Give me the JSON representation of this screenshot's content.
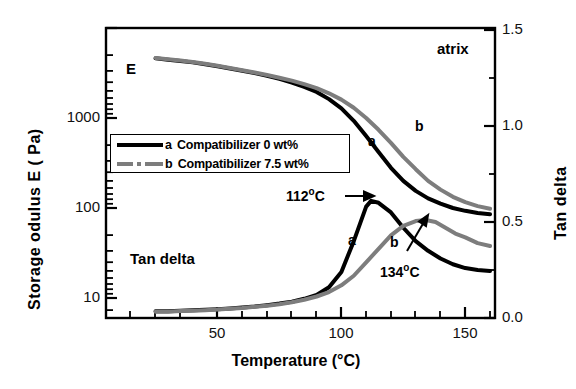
{
  "chart_data": {
    "type": "line",
    "title": "",
    "annotation_corner": "atrix",
    "xlabel": "Temperature (°C)",
    "ylabel_left": "Storage  odulus E ( Pa)",
    "ylabel_right": "Tan delta",
    "xlim": [
      5,
      162
    ],
    "xticks": [
      50,
      100,
      150
    ],
    "xticklabels": [
      "50",
      "100",
      "150"
    ],
    "left_axis_scale": "log",
    "ylim_left": [
      10,
      10000
    ],
    "yticks_left": [
      10,
      100,
      1000
    ],
    "yticklabels_left": [
      "10",
      "100",
      "1000"
    ],
    "ylim_right": [
      0.0,
      1.5
    ],
    "yticks_right": [
      0.0,
      0.5,
      1.0,
      1.5
    ],
    "yticklabels_right": [
      "0.0",
      "0.5",
      "1.0",
      "1.5"
    ],
    "grid": false,
    "in_plot_labels": [
      "E",
      "Tan delta"
    ],
    "curve_labels": [
      {
        "text": "a",
        "axis": "modulus"
      },
      {
        "text": "b",
        "axis": "modulus"
      },
      {
        "text": "a",
        "axis": "tandelta"
      },
      {
        "text": "b",
        "axis": "tandelta"
      }
    ],
    "annotations": [
      {
        "text": "112",
        "unit": "o",
        "suffix": "C",
        "points_to": "tan delta peak a",
        "value_c": 112
      },
      {
        "text": "134",
        "unit": "o",
        "suffix": "C",
        "points_to": "tan delta peak b",
        "value_c": 134
      }
    ],
    "series": [
      {
        "name": "a  Compatibilizer 0 wt%",
        "label": "a",
        "color": "#000000",
        "style": "solid",
        "axis": "left",
        "quantity": "Storage modulus E (Pa)",
        "x": [
          25,
          30,
          35,
          40,
          45,
          50,
          55,
          60,
          65,
          70,
          75,
          80,
          85,
          90,
          95,
          100,
          105,
          110,
          115,
          120,
          125,
          130,
          135,
          140,
          145,
          150,
          155,
          160
        ],
        "y": [
          4600,
          4450,
          4300,
          4150,
          3950,
          3750,
          3550,
          3350,
          3150,
          2950,
          2720,
          2480,
          2220,
          1950,
          1620,
          1280,
          930,
          630,
          420,
          280,
          200,
          155,
          128,
          112,
          100,
          93,
          88,
          85
        ]
      },
      {
        "name": "b  Compatibilizer 7.5 wt%",
        "label": "b",
        "color": "#7d7d7d",
        "style": "solid-gray",
        "axis": "left",
        "quantity": "Storage modulus E (Pa)",
        "x": [
          25,
          30,
          35,
          40,
          45,
          50,
          55,
          60,
          65,
          70,
          75,
          80,
          85,
          90,
          95,
          100,
          105,
          110,
          115,
          120,
          125,
          130,
          135,
          140,
          145,
          150,
          155,
          160
        ],
        "y": [
          4650,
          4500,
          4350,
          4200,
          4000,
          3800,
          3600,
          3400,
          3200,
          3000,
          2800,
          2600,
          2380,
          2150,
          1880,
          1600,
          1300,
          1000,
          740,
          530,
          370,
          270,
          200,
          160,
          133,
          116,
          105,
          98
        ]
      },
      {
        "name": "a  Compatibilizer 0 wt%",
        "label": "a",
        "color": "#000000",
        "style": "solid",
        "axis": "right",
        "quantity": "Tan delta",
        "x": [
          25,
          30,
          35,
          40,
          45,
          50,
          55,
          60,
          65,
          70,
          75,
          80,
          85,
          90,
          95,
          100,
          105,
          110,
          112,
          115,
          120,
          125,
          130,
          135,
          140,
          145,
          150,
          155,
          160
        ],
        "y": [
          0.035,
          0.035,
          0.038,
          0.04,
          0.043,
          0.046,
          0.05,
          0.055,
          0.06,
          0.067,
          0.075,
          0.085,
          0.1,
          0.12,
          0.16,
          0.24,
          0.4,
          0.58,
          0.61,
          0.6,
          0.55,
          0.47,
          0.4,
          0.35,
          0.31,
          0.28,
          0.26,
          0.25,
          0.245
        ]
      },
      {
        "name": "b  Compatibilizer 7.5 wt%",
        "label": "b",
        "color": "#7d7d7d",
        "style": "solid-gray",
        "axis": "right",
        "quantity": "Tan delta",
        "x": [
          25,
          30,
          35,
          40,
          45,
          50,
          55,
          60,
          65,
          70,
          75,
          80,
          85,
          90,
          95,
          100,
          105,
          110,
          115,
          120,
          125,
          130,
          134,
          138,
          142,
          146,
          150,
          155,
          160
        ],
        "y": [
          0.033,
          0.033,
          0.036,
          0.038,
          0.041,
          0.044,
          0.048,
          0.052,
          0.058,
          0.064,
          0.072,
          0.082,
          0.095,
          0.112,
          0.135,
          0.17,
          0.22,
          0.29,
          0.36,
          0.43,
          0.48,
          0.505,
          0.51,
          0.5,
          0.47,
          0.44,
          0.42,
          0.39,
          0.375
        ]
      }
    ]
  },
  "legend": {
    "entries": [
      {
        "tag": "a",
        "text": "Compatibilizer 0 wt%"
      },
      {
        "tag": "b",
        "text": "Compatibilizer 7.5 wt%"
      }
    ]
  }
}
